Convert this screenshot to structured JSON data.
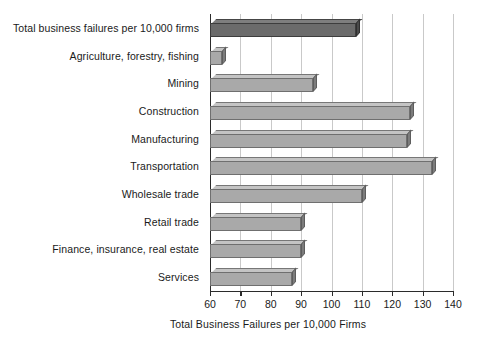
{
  "chart": {
    "xlabel": "Total Business Failures per 10,000 Firms",
    "ylabel": "",
    "title": ""
  },
  "axis": {
    "ticks": [
      "60",
      "70",
      "80",
      "90",
      "100",
      "110",
      "120",
      "130",
      "140"
    ],
    "min": 60,
    "max": 140,
    "step": 10
  },
  "chart_data": {
    "type": "bar",
    "orientation": "horizontal",
    "title": "",
    "xlabel": "Total Business Failures per 10,000 Firms",
    "ylabel": "",
    "xlim": [
      60,
      140
    ],
    "xticks": [
      60,
      70,
      80,
      90,
      100,
      110,
      120,
      130,
      140
    ],
    "grid": true,
    "legend": false,
    "categories": [
      "Total business failures per 10,000 firms",
      "Agriculture, forestry, fishing",
      "Mining",
      "Construction",
      "Manufacturing",
      "Transportation",
      "Wholesale trade",
      "Retail trade",
      "Finance, insurance, real estate",
      "Services"
    ],
    "values": [
      108,
      64,
      94,
      126,
      125,
      133,
      110,
      90,
      90,
      87
    ],
    "highlighted_index": 0,
    "bar_color": "#a9a9a9",
    "highlight_color": "#6b6b6b",
    "gridline_color": "#c9c9c9",
    "axis_color": "#2b2b2b"
  }
}
